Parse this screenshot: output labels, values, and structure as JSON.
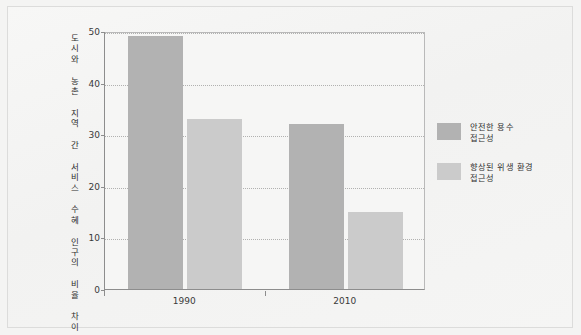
{
  "chart_data": {
    "type": "bar",
    "title": "",
    "subtitle": "",
    "xlabel": "",
    "ylabel": "도시와 농촌 지역 간 서비스 수혜 인구의 비율 차이",
    "categories": [
      "1990",
      "2010"
    ],
    "series": [
      {
        "name": "안전한 용수 접근성",
        "name_line1": "안전한 용수",
        "name_line2": "접근성",
        "color": "#b2b2b2",
        "values": [
          49,
          32
        ]
      },
      {
        "name": "향상된 위생 환경 접근성",
        "name_line1": "향상된 위생 환경",
        "name_line2": "접근성",
        "color": "#cbcbcb",
        "values": [
          33,
          15
        ]
      }
    ],
    "ylim": [
      0,
      50
    ],
    "yticks": [
      0,
      10,
      20,
      30,
      40,
      50
    ],
    "ytick_labels": [
      "0",
      "10",
      "20",
      "30",
      "40",
      "50"
    ],
    "grid": "horizontal-dotted",
    "legend_position": "right"
  },
  "figure": {
    "background_color": "#f4f4f3",
    "plot_background_color": "#f6f6f5",
    "axis_color": "#8d8d8d",
    "grid_color": "#9a9a9a",
    "text_color": "#2f2f2f"
  }
}
